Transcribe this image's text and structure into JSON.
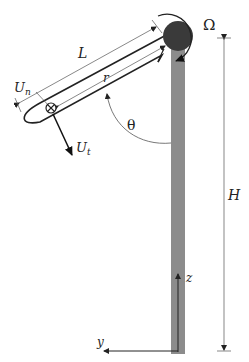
{
  "figure": {
    "colors": {
      "tower": "#8c8c8c",
      "hub": "#3a3a3a",
      "line": "#222222",
      "dimension": "#555555",
      "background": "#ffffff"
    },
    "labels": {
      "rotation": "Ω",
      "blade_length": "L",
      "radius": "r",
      "normal_velocity": "U",
      "normal_velocity_sub": "n",
      "tangential_velocity": "U",
      "tangential_velocity_sub": "t",
      "azimuth_angle": "θ",
      "tower_height": "H",
      "z_axis": "z",
      "y_axis": "y"
    },
    "symbols": {
      "into_page_marker": "⊗"
    }
  }
}
